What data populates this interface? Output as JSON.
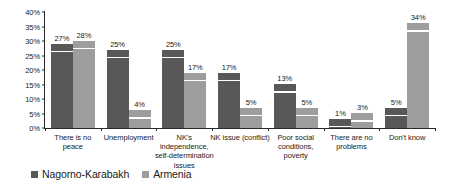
{
  "chart_data": {
    "type": "bar",
    "title": "",
    "subtitle": "",
    "xlabel": "",
    "ylabel": "",
    "ylim": [
      0,
      40
    ],
    "ytick_labels": [
      "0%",
      "5%",
      "10%",
      "15%",
      "20%",
      "25%",
      "30%",
      "35%",
      "40%"
    ],
    "ytick_values": [
      0,
      5,
      10,
      15,
      20,
      25,
      30,
      35,
      40
    ],
    "grid": false,
    "legend_position": "bottom-left",
    "value_suffix": "%",
    "categories": [
      "There is no peace",
      "Unemployment",
      "NK's independence, self-determination issues",
      "NK issue (conflict)",
      "Poor social conditions, poverty",
      "There are no problems",
      "Don't know"
    ],
    "category_lines": [
      [
        "There is no",
        "peace"
      ],
      [
        "Unemployment"
      ],
      [
        "NK's",
        "independence,",
        "self-determination",
        "issues"
      ],
      [
        "NK issue (conflict)"
      ],
      [
        "Poor social",
        "conditions,",
        "poverty"
      ],
      [
        "There are no",
        "problems"
      ],
      [
        "Don't know"
      ]
    ],
    "series": [
      {
        "name": "Nagorno-Karabakh",
        "color": "#585858",
        "values": [
          27,
          25,
          25,
          17,
          13,
          1,
          5
        ],
        "labels": [
          "27%",
          "25%",
          "25%",
          "17%",
          "13%",
          "1%",
          "5%"
        ]
      },
      {
        "name": "Armenia",
        "color": "#9d9d9d",
        "values": [
          28,
          4,
          17,
          5,
          5,
          3,
          34
        ],
        "labels": [
          "28%",
          "4%",
          "17%",
          "5%",
          "5%",
          "3%",
          "34%"
        ]
      }
    ]
  }
}
